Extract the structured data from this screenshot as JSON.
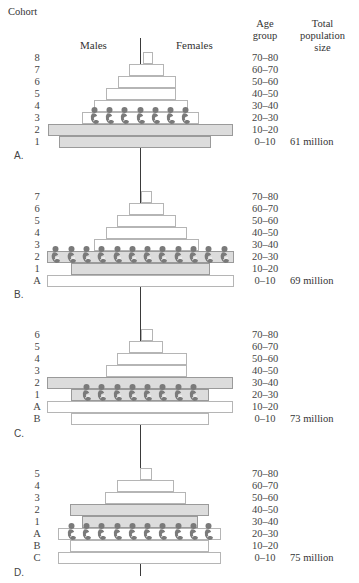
{
  "header": {
    "cohort": "Cohort",
    "males": "Males",
    "females": "Females",
    "age_group_line1": "Age",
    "age_group_line2": "group",
    "total_line1": "Total",
    "total_line2": "population",
    "total_line3": "size"
  },
  "colors": {
    "baby_boom_bar": "#dcdcdc",
    "normal_bar": "#ffffff",
    "baby_icon": "#7a7a7a",
    "axis": "#3a3a3a"
  },
  "panels": [
    {
      "letter": "A.",
      "total": "61 million",
      "rows": [
        {
          "cohort": "8",
          "age": "70–80",
          "left": 143,
          "right": 153,
          "gray": false
        },
        {
          "cohort": "7",
          "age": "60–70",
          "left": 129,
          "right": 164,
          "gray": false
        },
        {
          "cohort": "6",
          "age": "50–60",
          "left": 118,
          "right": 176,
          "gray": false
        },
        {
          "cohort": "5",
          "age": "40–50",
          "left": 106,
          "right": 176,
          "gray": false
        },
        {
          "cohort": "4",
          "age": "30–40",
          "left": 94,
          "right": 188,
          "gray": false
        },
        {
          "cohort": "3",
          "age": "20–30",
          "left": 82,
          "right": 199,
          "gray": false
        },
        {
          "cohort": "2",
          "age": "10–20",
          "left": 48,
          "right": 233,
          "gray": true
        },
        {
          "cohort": "1",
          "age": "0–10",
          "left": 59,
          "right": 211,
          "gray": true
        }
      ],
      "babies_row": 5,
      "babies_count": 7
    },
    {
      "letter": "B.",
      "total": "69 million",
      "rows": [
        {
          "cohort": "7",
          "age": "70–80",
          "left": 141,
          "right": 152,
          "gray": false
        },
        {
          "cohort": "6",
          "age": "60–70",
          "left": 129,
          "right": 164,
          "gray": false
        },
        {
          "cohort": "5",
          "age": "50–60",
          "left": 117,
          "right": 176,
          "gray": false
        },
        {
          "cohort": "4",
          "age": "40–50",
          "left": 106,
          "right": 187,
          "gray": false
        },
        {
          "cohort": "3",
          "age": "30–40",
          "left": 94,
          "right": 199,
          "gray": false
        },
        {
          "cohort": "2",
          "age": "20–30",
          "left": 47,
          "right": 234,
          "gray": true
        },
        {
          "cohort": "1",
          "age": "10–20",
          "left": 71,
          "right": 210,
          "gray": true
        },
        {
          "cohort": "A",
          "age": "0–10",
          "left": 47,
          "right": 234,
          "gray": false
        }
      ],
      "babies_row": 5,
      "babies_count": 12
    },
    {
      "letter": "C.",
      "total": "73 million",
      "rows": [
        {
          "cohort": "6",
          "age": "70–80",
          "left": 141,
          "right": 153,
          "gray": false
        },
        {
          "cohort": "5",
          "age": "60–70",
          "left": 129,
          "right": 163,
          "gray": false
        },
        {
          "cohort": "4",
          "age": "50–60",
          "left": 117,
          "right": 187,
          "gray": false
        },
        {
          "cohort": "3",
          "age": "40–50",
          "left": 106,
          "right": 187,
          "gray": false
        },
        {
          "cohort": "2",
          "age": "30–40",
          "left": 47,
          "right": 233,
          "gray": true
        },
        {
          "cohort": "1",
          "age": "20–30",
          "left": 71,
          "right": 209,
          "gray": true
        },
        {
          "cohort": "A",
          "age": "10–20",
          "left": 47,
          "right": 233,
          "gray": false
        },
        {
          "cohort": "B",
          "age": "0–10",
          "left": 71,
          "right": 209,
          "gray": false
        }
      ],
      "babies_row": 5,
      "babies_count": 8
    },
    {
      "letter": "D.",
      "total": "75 million",
      "rows": [
        {
          "cohort": "5",
          "age": "70–80",
          "left": 140,
          "right": 152,
          "gray": false
        },
        {
          "cohort": "4",
          "age": "60–70",
          "left": 117,
          "right": 174,
          "gray": false
        },
        {
          "cohort": "3",
          "age": "50–60",
          "left": 105,
          "right": 186,
          "gray": false
        },
        {
          "cohort": "2",
          "age": "40–50",
          "left": 70,
          "right": 209,
          "gray": true
        },
        {
          "cohort": "1",
          "age": "30–40",
          "left": 82,
          "right": 198,
          "gray": true
        },
        {
          "cohort": "A",
          "age": "20–30",
          "left": 58,
          "right": 221,
          "gray": false
        },
        {
          "cohort": "B",
          "age": "10–20",
          "left": 70,
          "right": 209,
          "gray": false
        },
        {
          "cohort": "C",
          "age": "0–10",
          "left": 58,
          "right": 221,
          "gray": false
        }
      ],
      "babies_row": 5,
      "babies_count": 10
    }
  ]
}
